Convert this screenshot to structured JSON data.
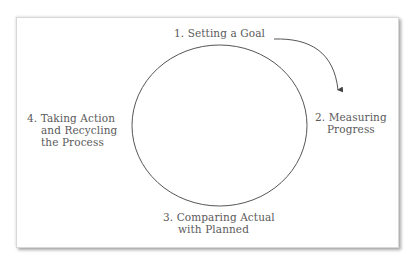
{
  "diagram": {
    "type": "cycle",
    "colors": {
      "text": "#5a5a5a",
      "stroke": "#555555",
      "background": "#ffffff"
    },
    "steps": [
      {
        "number": "1.",
        "lines": [
          "1. Setting a Goal"
        ]
      },
      {
        "number": "2.",
        "lines": [
          "2. Measuring",
          "Progress"
        ]
      },
      {
        "number": "3.",
        "lines": [
          "3. Comparing Actual",
          "with Planned"
        ]
      },
      {
        "number": "4.",
        "lines": [
          "4. Taking Action",
          "and Recycling",
          "the Process"
        ]
      }
    ],
    "connectors": [
      {
        "from": "step-1",
        "to": "step-2",
        "shape": "curved-arrow"
      }
    ]
  }
}
